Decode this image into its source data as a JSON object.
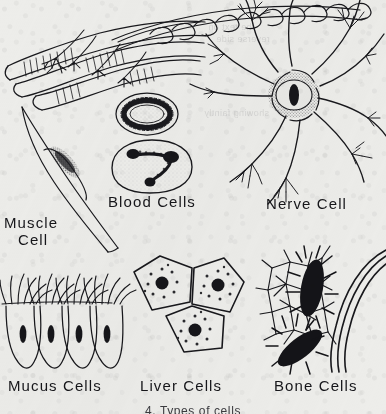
{
  "figure": {
    "title": "Types of Cells",
    "caption": "4. Types of cells",
    "background_color": "#ededea",
    "ink_color": "#16161a",
    "medium": "scanned black-and-white pen-and-ink textbook plate"
  },
  "labels": {
    "muscle": {
      "line1": "Muscle",
      "line2": "Cell"
    },
    "blood": {
      "text": "Blood  Cells"
    },
    "nerve": {
      "text": "Nerve Cell"
    },
    "mucus": {
      "text": "Mucus  Cells"
    },
    "liver": {
      "text": "Liver Cells"
    },
    "bone": {
      "text": "Bone Cells"
    }
  },
  "specimens": [
    {
      "id": "striated-muscle-fibers",
      "label": "Muscle Cell",
      "description": "Three cylindrical striated skeletal muscle fibers with cross-banding and branching nerve endings",
      "count": 3
    },
    {
      "id": "smooth-muscle-cell",
      "label": "Muscle Cell",
      "description": "Long spindle-shaped smooth muscle cell with elongated central nucleus",
      "count": 1
    },
    {
      "id": "red-blood-cell",
      "label": "Blood Cells",
      "description": "Biconcave red blood cell seen as a stippled ring",
      "count": 1
    },
    {
      "id": "white-blood-cell",
      "label": "Blood Cells",
      "description": "White blood cell with lobed stippled nucleus",
      "count": 1
    },
    {
      "id": "nerve-cell",
      "label": "Nerve Cell",
      "description": "Multipolar neuron with stippled cell body, dark nucleus and five branching dendrites plus an axon",
      "count": 1
    },
    {
      "id": "mucus-cells",
      "label": "Mucus Cells",
      "description": "Four ciliated columnar mucus cells in a row with dark nuclei",
      "count": 4
    },
    {
      "id": "liver-cells",
      "label": "Liver Cells",
      "description": "Three polygonal liver cells each with a dark nucleus ringed by granules",
      "count": 3
    },
    {
      "id": "bone-cells",
      "label": "Bone Cells",
      "description": "Two dark osteocytes in bone matrix with radiating canaliculi and lamellae",
      "count": 2
    }
  ],
  "bleed_through": {
    "line1": "the text on",
    "line2": "reverse side",
    "line3": "showing faintly"
  }
}
